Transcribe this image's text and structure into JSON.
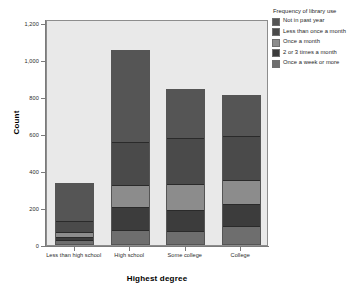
{
  "chart_data": {
    "type": "bar",
    "subtype": "stacked-bar",
    "title": "",
    "xlabel": "Highest degree",
    "ylabel": "Count",
    "ylim": [
      0,
      1200
    ],
    "yticks": [
      "0",
      "200",
      "400",
      "600",
      "800",
      "1,000",
      "1,200"
    ],
    "ytick_values": [
      0,
      200,
      400,
      600,
      800,
      1000,
      1200
    ],
    "grid": false,
    "legend_position": "right",
    "legend_title": "Frequency of library use",
    "categories": [
      "Less than high school",
      "High school",
      "Some college",
      "College"
    ],
    "series": [
      {
        "name": "Once a week or more",
        "color": "#6e6e6e",
        "values": [
          25,
          80,
          75,
          105
        ]
      },
      {
        "name": "2 or 3 times a month",
        "color": "#3c3c3c",
        "values": [
          20,
          125,
          115,
          115
        ]
      },
      {
        "name": "Once a month",
        "color": "#8c8c8c",
        "values": [
          25,
          120,
          140,
          130
        ]
      },
      {
        "name": "Less than once a month",
        "color": "#4a4a4a",
        "values": [
          60,
          230,
          250,
          240
        ]
      },
      {
        "name": "Not in past year",
        "color": "#555555",
        "values": [
          205,
          500,
          265,
          220
        ]
      }
    ],
    "totals": [
      335,
      1055,
      845,
      810
    ],
    "plot_background": "#e9e9e9"
  },
  "legend": {
    "title": "Frequency of library use",
    "items": [
      {
        "label": "Not in past year",
        "color": "#555555"
      },
      {
        "label": "Less than once a month",
        "color": "#4a4a4a"
      },
      {
        "label": "Once a month",
        "color": "#8c8c8c"
      },
      {
        "label": "2 or 3 times a month",
        "color": "#3c3c3c"
      },
      {
        "label": "Once a week or more",
        "color": "#6e6e6e"
      }
    ]
  },
  "axes": {
    "y_title": "Count",
    "x_title": "Highest degree"
  }
}
